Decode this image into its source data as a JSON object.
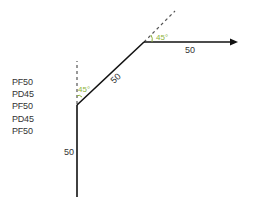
{
  "commands": [
    "PF50",
    "PD45",
    "PF50",
    "PD45",
    "PF50"
  ],
  "segments": [
    {
      "label": "50",
      "orientation": "vertical"
    },
    {
      "label": "50",
      "orientation": "diagonal"
    },
    {
      "label": "50",
      "orientation": "horizontal"
    }
  ],
  "angles": [
    {
      "label": "45°"
    },
    {
      "label": "45°"
    }
  ],
  "colors": {
    "line": "#111111",
    "dashed": "#555555",
    "angle": "#8db33a",
    "text": "#333333"
  }
}
